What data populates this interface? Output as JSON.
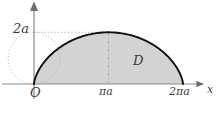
{
  "figure": {
    "kind": "cycloid-arch-region-diagram",
    "caption_region_letter": "D",
    "axes": {
      "x_axis_label": "x",
      "y_axis_label": "y",
      "origin_label": "O"
    },
    "tick_labels": {
      "y_top": "2a",
      "x_mid": "πa",
      "x_end": "2πa"
    },
    "colors": {
      "curve": "#000000",
      "shaded_region": "#d3d3d3",
      "axis": "#808080",
      "guide_dotted": "#a8a8a8",
      "label_text": "#3b3b3b",
      "background": "#ffffff"
    }
  },
  "chart_data": {
    "type": "line",
    "title": "",
    "xlabel": "x",
    "ylabel": "y",
    "xlim": [
      0,
      6.2832
    ],
    "ylim": [
      0,
      2
    ],
    "grid": false,
    "legend": null,
    "parametric": {
      "name": "cycloid arch",
      "x_expr": "a(t - sin t)",
      "y_expr": "a(1 - cos t)",
      "t_range": [
        0,
        6.2832
      ],
      "a": 1
    },
    "x_ticks": [
      0,
      3.1416,
      6.2832
    ],
    "x_tick_labels": [
      "O",
      "πa",
      "2πa"
    ],
    "y_ticks": [
      2
    ],
    "y_tick_labels": [
      "2a"
    ],
    "annotations": [
      {
        "text": "D",
        "x": 4.0,
        "y": 0.78,
        "note": "shaded region under one arch"
      },
      {
        "text": "2a",
        "x": 0.0,
        "y": 2.0,
        "note": "apex height tick"
      },
      {
        "text": "πa",
        "x": 3.1416,
        "y": 0.0,
        "note": "apex x-position"
      },
      {
        "text": "2πa",
        "x": 6.2832,
        "y": 0.0,
        "note": "arch end"
      }
    ],
    "guides": [
      {
        "kind": "dotted-circle",
        "center": [
          0.0,
          1.0
        ],
        "radius": 1.0,
        "note": "rolling circle tangent at origin"
      },
      {
        "kind": "dotted-horizontal",
        "y": 2.0,
        "x_from": 0.0,
        "x_to": 3.1416
      },
      {
        "kind": "dashdot-vertical",
        "x": 3.1416,
        "y_from": 0.0,
        "y_to": 2.0
      }
    ],
    "shaded_regions": [
      {
        "name": "D",
        "between": [
          "cycloid arch",
          "x-axis"
        ],
        "x_from": 0.0,
        "x_to": 6.2832,
        "color": "#d3d3d3"
      }
    ]
  }
}
